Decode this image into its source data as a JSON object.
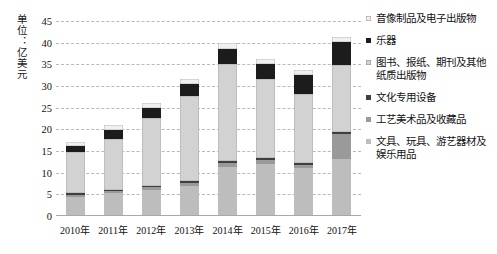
{
  "axis": {
    "unit_label": "单位：亿美元",
    "y_ticks": [
      "45",
      "40",
      "35",
      "30",
      "25",
      "20",
      "15",
      "10",
      "5",
      "0"
    ],
    "x_ticks": [
      "2010年",
      "2011年",
      "2012年",
      "2013年",
      "2014年",
      "2015年",
      "2016年",
      "2017年"
    ]
  },
  "legend": {
    "items": [
      {
        "label": "音像制品及电子出版物",
        "color": "#f0f0f0"
      },
      {
        "label": "乐器",
        "color": "#1c1c1c"
      },
      {
        "label": "图书、报纸、期刊及其他纸质出版物",
        "color": "#d2d2d2"
      },
      {
        "label": "文化专用设备",
        "color": "#3f3f3f"
      },
      {
        "label": "工艺美术品及收藏品",
        "color": "#9a9a9a"
      },
      {
        "label": "文具、玩具、游艺器材及娱乐用品",
        "color": "#bdbdbd"
      }
    ]
  },
  "chart_data": {
    "type": "bar",
    "stacked": true,
    "title": "",
    "xlabel": "",
    "ylabel": "单位：亿美元",
    "ylim": [
      0,
      45
    ],
    "ytick_step": 5,
    "grid": true,
    "legend_position": "right",
    "categories": [
      "2010年",
      "2011年",
      "2012年",
      "2013年",
      "2014年",
      "2015年",
      "2016年",
      "2017年"
    ],
    "series": [
      {
        "name": "文具、玩具、游艺器材及娱乐用品",
        "color": "#bdbdbd",
        "values": [
          4.5,
          5.3,
          6.1,
          7.0,
          11.3,
          12.1,
          11.0,
          13.2
        ]
      },
      {
        "name": "工艺美术品及收藏品",
        "color": "#9a9a9a",
        "values": [
          0.4,
          0.5,
          0.5,
          0.6,
          0.9,
          0.9,
          0.8,
          5.8
        ]
      },
      {
        "name": "文化专用设备",
        "color": "#3f3f3f",
        "values": [
          0.3,
          0.3,
          0.4,
          0.4,
          0.5,
          0.5,
          0.4,
          0.5
        ]
      },
      {
        "name": "图书、报纸、期刊及其他纸质出版物",
        "color": "#d2d2d2",
        "values": [
          9.5,
          11.7,
          15.7,
          19.7,
          22.3,
          18.2,
          16.0,
          15.4
        ]
      },
      {
        "name": "乐器",
        "color": "#1c1c1c",
        "values": [
          1.5,
          2.0,
          2.2,
          2.7,
          3.6,
          3.4,
          4.3,
          5.2
        ]
      },
      {
        "name": "音像制品及电子出版物",
        "color": "#f0f0f0",
        "values": [
          0.8,
          1.2,
          1.1,
          1.2,
          1.4,
          1.2,
          1.2,
          1.3
        ]
      }
    ],
    "totals": [
      17.0,
      21.0,
      26.0,
      31.6,
      40.0,
      36.3,
      33.7,
      41.4
    ]
  }
}
